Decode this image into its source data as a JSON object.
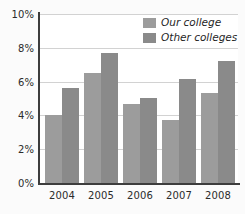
{
  "chart_data": {
    "type": "bar",
    "title": "",
    "subtitle": "",
    "xlabel": "",
    "ylabel": "",
    "categories": [
      "2004",
      "2005",
      "2006",
      "2007",
      "2008"
    ],
    "series": [
      {
        "name": "Our college",
        "color": "#9c9c9c",
        "values": [
          4.0,
          6.5,
          4.7,
          3.75,
          5.3
        ]
      },
      {
        "name": "Other colleges",
        "color": "#8a8a8a",
        "values": [
          5.6,
          7.7,
          5.05,
          6.15,
          7.2
        ]
      }
    ],
    "ylim": [
      0,
      10
    ],
    "ytick_values": [
      0,
      2,
      4,
      6,
      8,
      10
    ],
    "ytick_labels": [
      "0%",
      "2%",
      "4%",
      "6%",
      "8%",
      "10%"
    ],
    "grid": true,
    "grid_axis": "y",
    "legend_position": "top-right",
    "axis_color": "#3d3d3d",
    "grid_color": "#d2d2d2",
    "background_color": "#ffffff"
  }
}
